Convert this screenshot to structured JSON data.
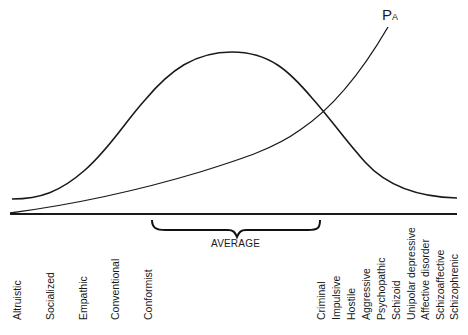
{
  "diagram": {
    "curve_label": {
      "main": "P",
      "subscript": "A"
    },
    "range_label": "AVERAGE",
    "curves": [
      {
        "name": "distribution",
        "shape": "bell curve"
      },
      {
        "name": "P_A",
        "shape": "rising exponential"
      }
    ],
    "labels_left": [
      "Altruistic",
      "Socialized",
      "Empathic",
      "Conventional",
      "Conformist"
    ],
    "labels_right": [
      "Criminal",
      "Impulsive",
      "Hostile",
      "Aggressive",
      "Psychopathic",
      "Schizoid",
      "Unipolar depressive",
      "Affective disorder",
      "Schizoaffective",
      "Schizophrenic"
    ]
  }
}
